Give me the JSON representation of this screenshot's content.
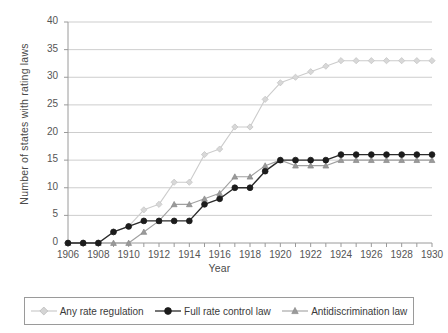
{
  "chart_data": {
    "type": "line",
    "title": "",
    "xlabel": "Year",
    "ylabel": "Number of states with rating laws",
    "xlim": [
      1906,
      1930
    ],
    "ylim": [
      0,
      40
    ],
    "ytick_step": 5,
    "yticks": [
      0,
      5,
      10,
      15,
      20,
      25,
      30,
      35,
      40
    ],
    "xticks": [
      1906,
      1907,
      1908,
      1909,
      1910,
      1911,
      1912,
      1913,
      1914,
      1915,
      1916,
      1917,
      1918,
      1919,
      1920,
      1921,
      1922,
      1923,
      1924,
      1925,
      1926,
      1927,
      1928,
      1929,
      1930
    ],
    "xtick_labels": [
      1906,
      1908,
      1910,
      1912,
      1914,
      1916,
      1918,
      1920,
      1922,
      1924,
      1926,
      1928,
      1930
    ],
    "grid": "horizontal",
    "legend_position": "bottom",
    "x": [
      1906,
      1907,
      1908,
      1909,
      1910,
      1911,
      1912,
      1913,
      1914,
      1915,
      1916,
      1917,
      1918,
      1919,
      1920,
      1921,
      1922,
      1923,
      1924,
      1925,
      1926,
      1927,
      1928,
      1929,
      1930
    ],
    "series": [
      {
        "name": "Any rate regulation",
        "color": "#cccccc",
        "marker": "diamond",
        "values": [
          0,
          0,
          0,
          2,
          3,
          6,
          7,
          11,
          11,
          16,
          17,
          21,
          21,
          26,
          29,
          30,
          31,
          32,
          33,
          33,
          33,
          33,
          33,
          33,
          33
        ]
      },
      {
        "name": "Full rate control law",
        "color": "#2b2b2b",
        "marker": "circle",
        "values": [
          0,
          0,
          0,
          2,
          3,
          4,
          4,
          4,
          4,
          7,
          8,
          10,
          10,
          13,
          15,
          15,
          15,
          15,
          16,
          16,
          16,
          16,
          16,
          16,
          16
        ]
      },
      {
        "name": "Antidiscrimination law",
        "color": "#a0a0a0",
        "marker": "triangle",
        "values": [
          0,
          0,
          0,
          0,
          0,
          2,
          4,
          7,
          7,
          8,
          9,
          12,
          12,
          14,
          15,
          14,
          14,
          14,
          15,
          15,
          15,
          15,
          15,
          15,
          15
        ]
      }
    ]
  },
  "legend": {
    "items": [
      {
        "label": "Any rate regulation"
      },
      {
        "label": "Full rate control law"
      },
      {
        "label": "Antidiscrimination law"
      }
    ]
  }
}
